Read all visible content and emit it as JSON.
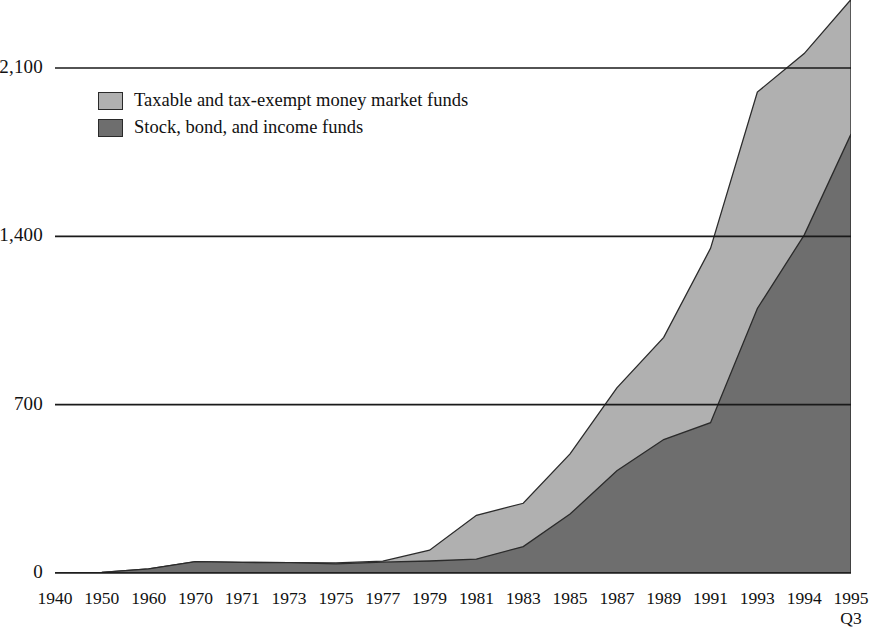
{
  "chart_data": {
    "type": "area",
    "title": "",
    "subtitle": "",
    "xlabel": "",
    "ylabel": "",
    "stacked": true,
    "grid": true,
    "legend_position": "inside-top-left",
    "ylim": [
      0,
      2100
    ],
    "yticks": [
      "0",
      "700",
      "1,400",
      "2,100"
    ],
    "ytick_values": [
      0,
      700,
      1400,
      2100
    ],
    "categories": [
      "1940",
      "1950",
      "1960",
      "1970",
      "1971",
      "1973",
      "1975",
      "1977",
      "1979",
      "1981",
      "1983",
      "1985",
      "1987",
      "1989",
      "1991",
      "1993",
      "1994",
      "1995"
    ],
    "category_sublabels": [
      "",
      "",
      "",
      "",
      "",
      "",
      "",
      "",
      "",
      "",
      "",
      "",
      "",
      "",
      "",
      "",
      "",
      "Q3"
    ],
    "series": [
      {
        "name": "Stock, bond, and income funds",
        "color": "#6e6e6e",
        "values": [
          0,
          3,
          17,
          47,
          44,
          43,
          38,
          45,
          50,
          58,
          110,
          245,
          425,
          555,
          625,
          1100,
          1405,
          1825
        ]
      },
      {
        "name": "Taxable and tax-exempt money market funds",
        "color": "#b0b0b0",
        "values": [
          0,
          0,
          0,
          0,
          0,
          0,
          4,
          4,
          45,
          182,
          180,
          250,
          345,
          425,
          725,
          900,
          755,
          560
        ]
      }
    ],
    "totals": [
      0,
      3,
      17,
      47,
      44,
      43,
      42,
      49,
      95,
      240,
      290,
      495,
      770,
      980,
      1350,
      2000,
      2160,
      2385
    ],
    "annotations": []
  },
  "legend": {
    "items": [
      {
        "label": "Taxable and tax-exempt money market funds",
        "color": "#b0b0b0"
      },
      {
        "label": "Stock, bond, and income funds",
        "color": "#6e6e6e"
      }
    ]
  },
  "colors": {
    "money_market": "#b0b0b0",
    "stock_bond_income": "#6e6e6e",
    "axis": "#1a1a1a",
    "grid": "#1a1a1a",
    "background": "#ffffff"
  }
}
